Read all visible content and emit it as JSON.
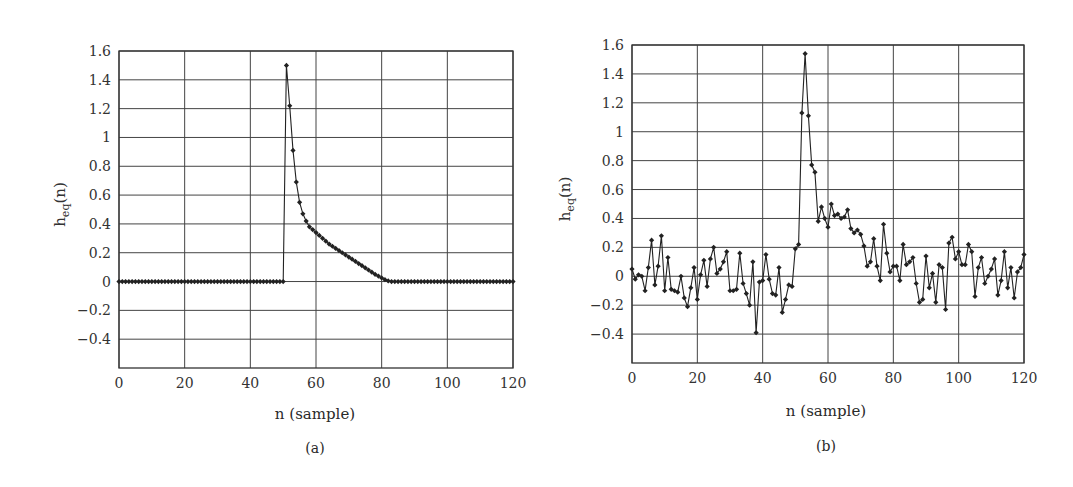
{
  "figure": {
    "panels": [
      {
        "id": "a",
        "caption": "(a)",
        "xlabel": "n (sample)",
        "ylabel_base": "h",
        "ylabel_sub": "eq",
        "ylabel_arg": "(n)"
      },
      {
        "id": "b",
        "caption": "(b)",
        "xlabel": "n (sample)",
        "ylabel_base": "h",
        "ylabel_sub": "eq",
        "ylabel_arg": "(n)"
      }
    ]
  },
  "chart_data": [
    {
      "type": "line",
      "title": "(a)",
      "xlabel": "n (sample)",
      "ylabel": "h_eq(n)",
      "xlim": [
        0,
        120
      ],
      "ylim": [
        -0.6,
        1.6
      ],
      "xticks": [
        0,
        20,
        40,
        60,
        80,
        100,
        120
      ],
      "yticks": [
        1.6,
        1.4,
        1.2,
        1,
        0.8,
        0.6,
        0.4,
        0.2,
        0,
        -0.2,
        -0.4
      ],
      "ytick_labels": [
        "1.6",
        "1.4",
        "1.2",
        "1",
        "0.8",
        "0.6",
        "0.4",
        "0.2",
        "0",
        "−0.2",
        "−0.4"
      ],
      "grid": true,
      "marker": "diamond",
      "color": "#222222",
      "x": [
        0,
        1,
        2,
        3,
        4,
        5,
        6,
        7,
        8,
        9,
        10,
        11,
        12,
        13,
        14,
        15,
        16,
        17,
        18,
        19,
        20,
        21,
        22,
        23,
        24,
        25,
        26,
        27,
        28,
        29,
        30,
        31,
        32,
        33,
        34,
        35,
        36,
        37,
        38,
        39,
        40,
        41,
        42,
        43,
        44,
        45,
        46,
        47,
        48,
        49,
        50,
        51,
        52,
        53,
        54,
        55,
        56,
        57,
        58,
        59,
        60,
        61,
        62,
        63,
        64,
        65,
        66,
        67,
        68,
        69,
        70,
        71,
        72,
        73,
        74,
        75,
        76,
        77,
        78,
        79,
        80,
        81,
        82,
        83,
        84,
        85,
        86,
        87,
        88,
        89,
        90,
        91,
        92,
        93,
        94,
        95,
        96,
        97,
        98,
        99,
        100,
        101,
        102,
        103,
        104,
        105,
        106,
        107,
        108,
        109,
        110,
        111,
        112,
        113,
        114,
        115,
        116,
        117,
        118,
        119,
        120
      ],
      "values": [
        0,
        0,
        0,
        0,
        0,
        0,
        0,
        0,
        0,
        0,
        0,
        0,
        0,
        0,
        0,
        0,
        0,
        0,
        0,
        0,
        0,
        0,
        0,
        0,
        0,
        0,
        0,
        0,
        0,
        0,
        0,
        0,
        0,
        0,
        0,
        0,
        0,
        0,
        0,
        0,
        0,
        0,
        0,
        0,
        0,
        0,
        0,
        0,
        0,
        0,
        0,
        1.5,
        1.22,
        0.91,
        0.69,
        0.55,
        0.47,
        0.42,
        0.38,
        0.36,
        0.34,
        0.32,
        0.3,
        0.28,
        0.26,
        0.245,
        0.23,
        0.215,
        0.2,
        0.185,
        0.17,
        0.155,
        0.14,
        0.125,
        0.11,
        0.095,
        0.08,
        0.065,
        0.05,
        0.038,
        0.025,
        0.013,
        0.004,
        0,
        0,
        0,
        0,
        0,
        0,
        0,
        0,
        0,
        0,
        0,
        0,
        0,
        0,
        0,
        0,
        0,
        0,
        0,
        0,
        0,
        0,
        0,
        0,
        0,
        0,
        0,
        0,
        0,
        0,
        0,
        0,
        0,
        0,
        0,
        0,
        0,
        0
      ]
    },
    {
      "type": "line",
      "title": "(b)",
      "xlabel": "n (sample)",
      "ylabel": "h_eq(n)",
      "xlim": [
        0,
        120
      ],
      "ylim": [
        -0.6,
        1.6
      ],
      "xticks": [
        0,
        20,
        40,
        60,
        80,
        100,
        120
      ],
      "yticks": [
        1.6,
        1.4,
        1.2,
        1,
        0.8,
        0.6,
        0.4,
        0.2,
        0,
        -0.2,
        -0.4
      ],
      "ytick_labels": [
        "1.6",
        "1.4",
        "1.2",
        "1",
        "0.8",
        "0.6",
        "0.4",
        "0.2",
        "0",
        "−0.2",
        "−0.4"
      ],
      "grid": true,
      "marker": "diamond",
      "color": "#222222",
      "x": [
        0,
        1,
        2,
        3,
        4,
        5,
        6,
        7,
        8,
        9,
        10,
        11,
        12,
        13,
        14,
        15,
        16,
        17,
        18,
        19,
        20,
        21,
        22,
        23,
        24,
        25,
        26,
        27,
        28,
        29,
        30,
        31,
        32,
        33,
        34,
        35,
        36,
        37,
        38,
        39,
        40,
        41,
        42,
        43,
        44,
        45,
        46,
        47,
        48,
        49,
        50,
        51,
        52,
        53,
        54,
        55,
        56,
        57,
        58,
        59,
        60,
        61,
        62,
        63,
        64,
        65,
        66,
        67,
        68,
        69,
        70,
        71,
        72,
        73,
        74,
        75,
        76,
        77,
        78,
        79,
        80,
        81,
        82,
        83,
        84,
        85,
        86,
        87,
        88,
        89,
        90,
        91,
        92,
        93,
        94,
        95,
        96,
        97,
        98,
        99,
        100,
        101,
        102,
        103,
        104,
        105,
        106,
        107,
        108,
        109,
        110,
        111,
        112,
        113,
        114,
        115,
        116,
        117,
        118,
        119,
        120
      ],
      "values": [
        0.05,
        -0.02,
        0.01,
        0.0,
        -0.1,
        0.06,
        0.25,
        -0.06,
        0.07,
        0.28,
        -0.1,
        0.13,
        -0.09,
        -0.1,
        -0.11,
        0.0,
        -0.15,
        -0.21,
        -0.08,
        0.06,
        -0.16,
        0.01,
        0.11,
        -0.07,
        0.12,
        0.2,
        0.02,
        0.05,
        0.1,
        0.17,
        -0.1,
        -0.1,
        -0.09,
        0.16,
        -0.05,
        -0.12,
        -0.2,
        0.1,
        -0.39,
        -0.04,
        -0.03,
        0.15,
        -0.02,
        -0.12,
        -0.13,
        0.06,
        -0.25,
        -0.16,
        -0.06,
        -0.07,
        0.19,
        0.22,
        1.13,
        1.54,
        1.11,
        0.77,
        0.72,
        0.38,
        0.48,
        0.4,
        0.34,
        0.5,
        0.42,
        0.43,
        0.4,
        0.41,
        0.46,
        0.33,
        0.3,
        0.32,
        0.29,
        0.21,
        0.07,
        0.1,
        0.26,
        0.07,
        -0.03,
        0.36,
        0.16,
        0.03,
        0.07,
        0.07,
        -0.03,
        0.22,
        0.08,
        0.1,
        0.13,
        -0.05,
        -0.18,
        -0.16,
        0.14,
        -0.08,
        0.02,
        -0.18,
        0.08,
        0.06,
        -0.23,
        0.23,
        0.27,
        0.12,
        0.17,
        0.08,
        0.08,
        0.22,
        0.17,
        -0.14,
        0.06,
        0.13,
        -0.05,
        0.0,
        0.05,
        0.12,
        -0.13,
        -0.03,
        0.17,
        -0.08,
        0.06,
        -0.15,
        0.03,
        0.06,
        0.15
      ]
    }
  ]
}
